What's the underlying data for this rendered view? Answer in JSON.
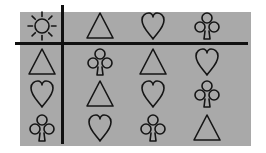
{
  "figure": {
    "background_color": "#a9a9a9",
    "line_color": "#111111",
    "grid": [
      [
        "sun",
        "triangle",
        "heart",
        "club"
      ],
      [
        "triangle",
        "club",
        "triangle",
        "heart"
      ],
      [
        "heart",
        "triangle",
        "heart",
        "club"
      ],
      [
        "club",
        "heart",
        "club",
        "triangle"
      ]
    ]
  }
}
